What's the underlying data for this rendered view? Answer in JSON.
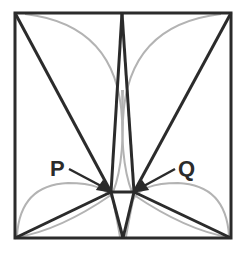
{
  "diagram": {
    "type": "geometry-figure",
    "colors": {
      "line": "#2b2b2b",
      "arc": "#b3b3b3",
      "background": "#ffffff"
    },
    "square": {
      "x1": 15,
      "y1": 13,
      "x2": 231,
      "y2": 238
    },
    "points": {
      "top_mid": [
        122,
        13
      ],
      "bottom_mid": [
        123,
        238
      ],
      "P": [
        111,
        192
      ],
      "Q": [
        134,
        192
      ]
    },
    "labels": {
      "P": "P",
      "Q": "Q"
    }
  }
}
